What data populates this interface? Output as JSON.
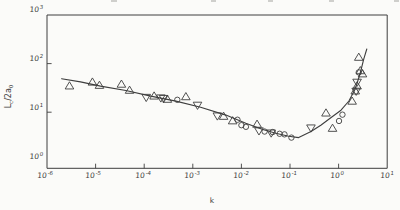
{
  "figure": {
    "paper": "#fbfbf9",
    "ink": "#3e3e3e"
  },
  "axes": {
    "x_label": "k",
    "y_label": {
      "base1": "L",
      "sub1": "c",
      "base2": "/2a",
      "sub2": "0"
    }
  },
  "chart_data": {
    "type": "scatter",
    "title": "",
    "xlabel": "k",
    "ylabel": "Lc/2a0",
    "x_scale": "log",
    "y_scale": "log",
    "xlim": [
      1e-06,
      10
    ],
    "ylim": [
      1,
      1000
    ],
    "grid": false,
    "legend": false,
    "x_ticks": [
      {
        "base": "10",
        "exp": "-6"
      },
      {
        "base": "10",
        "exp": "-5"
      },
      {
        "base": "10",
        "exp": "-4"
      },
      {
        "base": "10",
        "exp": "-3"
      },
      {
        "base": "10",
        "exp": "-2"
      },
      {
        "base": "10",
        "exp": "-1"
      },
      {
        "base": "10",
        "exp": "0"
      },
      {
        "base": "10",
        "exp": "1"
      }
    ],
    "y_ticks": [
      {
        "base": "10",
        "exp": "3"
      },
      {
        "base": "10",
        "exp": "2"
      },
      {
        "base": "10",
        "exp": "1"
      },
      {
        "base": "10",
        "exp": "0"
      }
    ],
    "series": [
      {
        "name": "triangle-up",
        "marker": "triangle-up",
        "points": [
          [
            2.9e-06,
            35
          ],
          [
            8.6e-06,
            42
          ],
          [
            1.2e-05,
            36
          ],
          [
            3.4e-05,
            38
          ],
          [
            5e-05,
            28.5
          ],
          [
            0.00016,
            21.7
          ],
          [
            0.0003,
            18.6
          ],
          [
            0.00072,
            21
          ],
          [
            0.0043,
            8.3
          ],
          [
            0.0066,
            6.7
          ],
          [
            0.021,
            5.7
          ],
          [
            0.55,
            9.7
          ],
          [
            0.75,
            4.7
          ],
          [
            1.9,
            17
          ],
          [
            2.2,
            27.6
          ],
          [
            2.4,
            35
          ],
          [
            2.6,
            136
          ],
          [
            2.8,
            72
          ],
          [
            3.1,
            62
          ]
        ]
      },
      {
        "name": "triangle-down",
        "marker": "triangle-down",
        "points": [
          [
            0.00011,
            20
          ],
          [
            0.00022,
            19.5
          ],
          [
            0.00025,
            19
          ],
          [
            0.00125,
            13.8
          ],
          [
            0.0032,
            8.3
          ],
          [
            0.023,
            4.1
          ],
          [
            0.041,
            3.7
          ],
          [
            0.27,
            4.7
          ],
          [
            2.3,
            26.8
          ],
          [
            2.4,
            41
          ]
        ]
      },
      {
        "name": "circle",
        "marker": "circle",
        "points": [
          [
            0.00048,
            18
          ],
          [
            0.0083,
            7.0
          ],
          [
            0.01,
            5.4
          ],
          [
            0.0124,
            5.0
          ],
          [
            0.03,
            4.0
          ],
          [
            0.044,
            3.9
          ],
          [
            0.061,
            3.6
          ],
          [
            0.077,
            3.5
          ],
          [
            0.107,
            3.0
          ],
          [
            1.02,
            6.6
          ],
          [
            1.2,
            8.9
          ],
          [
            2.6,
            66
          ]
        ]
      }
    ],
    "fit_curve": {
      "name": "fit-curve",
      "points": [
        [
          2e-06,
          49
        ],
        [
          4.9e-06,
          42
        ],
        [
          1.26e-05,
          34.5
        ],
        [
          4.2e-05,
          28
        ],
        [
          0.000136,
          21.4
        ],
        [
          0.00045,
          16.9
        ],
        [
          0.00145,
          12.7
        ],
        [
          0.0048,
          8.7
        ],
        [
          0.0123,
          5.9
        ],
        [
          0.0275,
          4.4
        ],
        [
          0.051,
          3.7
        ],
        [
          0.094,
          3.2
        ],
        [
          0.151,
          3.0
        ],
        [
          0.27,
          4.0
        ],
        [
          0.43,
          5.4
        ],
        [
          0.69,
          7.7
        ],
        [
          1.12,
          11
        ],
        [
          1.63,
          17
        ],
        [
          2.2,
          30
        ],
        [
          2.75,
          61
        ],
        [
          3.3,
          125
        ],
        [
          3.8,
          200
        ]
      ]
    }
  }
}
